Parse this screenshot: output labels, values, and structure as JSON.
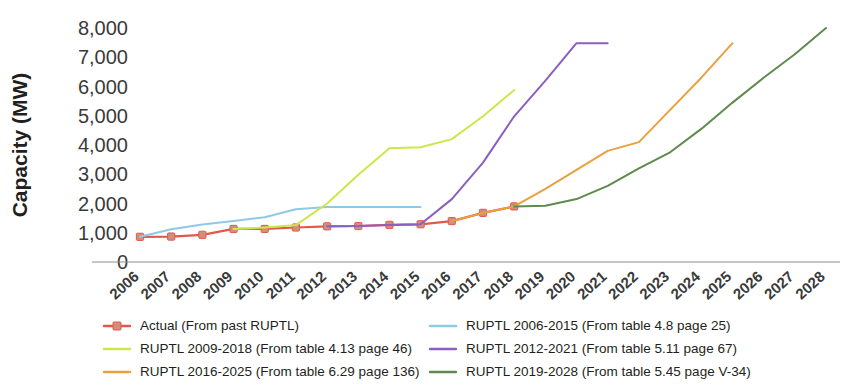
{
  "chart_data": {
    "type": "line",
    "title": "",
    "xlabel": "",
    "ylabel": "Capacity (MW)",
    "ylim": [
      0,
      8000
    ],
    "yticks": [
      "0",
      "1,000",
      "2,000",
      "3,000",
      "4,000",
      "5,000",
      "6,000",
      "7,000",
      "8,000"
    ],
    "ytick_values": [
      0,
      1000,
      2000,
      3000,
      4000,
      5000,
      6000,
      7000,
      8000
    ],
    "categories": [
      "2006",
      "2007",
      "2008",
      "2009",
      "2010",
      "2011",
      "2012",
      "2013",
      "2014",
      "2015",
      "2016",
      "2017",
      "2018",
      "2019",
      "2020",
      "2021",
      "2022",
      "2023",
      "2024",
      "2025",
      "2026",
      "2027",
      "2028"
    ],
    "grid": false,
    "legend_position": "bottom",
    "series": [
      {
        "name": "Actual (From past RUPTL)",
        "legend_label": "Actual (From past RUPTL)",
        "color": "#e2594a",
        "marker": "square",
        "marker_color": "#d08f7e",
        "x": [
          "2006",
          "2007",
          "2008",
          "2009",
          "2010",
          "2011",
          "2012",
          "2013",
          "2014",
          "2015",
          "2016",
          "2017",
          "2018"
        ],
        "values": [
          860,
          870,
          930,
          1130,
          1130,
          1180,
          1220,
          1230,
          1270,
          1290,
          1400,
          1680,
          1900
        ]
      },
      {
        "name": "RUPTL 2006-2015 (From table 4.8 page 25)",
        "legend_label": "RUPTL 2006-2015 (From table 4.8 page 25)",
        "color": "#8ec9e8",
        "marker": "none",
        "x": [
          "2006",
          "2007",
          "2008",
          "2009",
          "2010",
          "2011",
          "2012",
          "2013",
          "2014",
          "2015"
        ],
        "values": [
          860,
          1120,
          1280,
          1400,
          1530,
          1800,
          1880,
          1880,
          1880,
          1880
        ]
      },
      {
        "name": "RUPTL 2009-2018 (From table 4.13 page 46)",
        "legend_label": "RUPTL 2009-2018 (From table 4.13 page 46)",
        "color": "#cfe64a",
        "marker": "none",
        "x": [
          "2009",
          "2010",
          "2011",
          "2012",
          "2013",
          "2014",
          "2015",
          "2016",
          "2017",
          "2018"
        ],
        "values": [
          1130,
          1180,
          1260,
          2000,
          2980,
          3890,
          3920,
          4200,
          4980,
          5880
        ]
      },
      {
        "name": "RUPTL 2012-2021 (From table 5.11 page 67)",
        "legend_label": "RUPTL 2012-2021 (From table 5.11 page 67)",
        "color": "#8b5fbf",
        "marker": "none",
        "x": [
          "2012",
          "2013",
          "2014",
          "2015",
          "2016",
          "2017",
          "2018",
          "2019",
          "2020",
          "2021"
        ],
        "values": [
          1220,
          1230,
          1270,
          1290,
          2150,
          3400,
          4980,
          6200,
          7480,
          7480
        ]
      },
      {
        "name": "RUPTL 2016-2025 (From table 6.29 page 136)",
        "legend_label": "RUPTL 2016-2025 (From table 6.29 page 136)",
        "color": "#e8a13c",
        "marker": "none",
        "x": [
          "2016",
          "2017",
          "2018",
          "2019",
          "2020",
          "2021",
          "2022",
          "2023",
          "2024",
          "2025"
        ],
        "values": [
          1400,
          1680,
          1900,
          2500,
          3150,
          3800,
          4100,
          5200,
          6300,
          7480
        ]
      },
      {
        "name": "RUPTL 2019-2028 (From table 5.45 page V-34)",
        "legend_label": "RUPTL 2019-2028 (From table 5.45 page V-34)",
        "color": "#5f8a4e",
        "marker": "none",
        "x": [
          "2018",
          "2019",
          "2020",
          "2021",
          "2022",
          "2023",
          "2024",
          "2025",
          "2026",
          "2027",
          "2028"
        ],
        "values": [
          1900,
          1920,
          2150,
          2600,
          3200,
          3750,
          4550,
          5450,
          6300,
          7100,
          8000
        ]
      }
    ]
  },
  "legend": {
    "left_column": [
      "Actual (From past RUPTL)",
      "RUPTL 2009-2018 (From table 4.13 page 46)",
      "RUPTL 2016-2025 (From table 6.29 page 136)"
    ],
    "right_column": [
      "RUPTL 2006-2015 (From table 4.8 page 25)",
      "RUPTL 2012-2021 (From table 5.11 page 67)",
      "RUPTL 2019-2028 (From table 5.45 page V-34)"
    ]
  }
}
